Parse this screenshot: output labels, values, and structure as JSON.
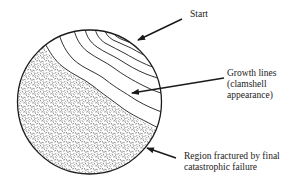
{
  "diagram": {
    "labels": {
      "start": "Start",
      "growth_lines": [
        "Growth lines",
        "(clamshell",
        "appearance)"
      ],
      "final_failure": [
        "Region fractured by final",
        "catastrophic failure"
      ]
    },
    "regions": [
      {
        "name": "fatigue-crack-growth-zone",
        "fill": "#ffffff",
        "pattern": "concentric growth lines"
      },
      {
        "name": "final-fracture-zone",
        "fill": "stippled",
        "pattern": "random dashes"
      }
    ],
    "colors": {
      "ink": "#1a1a1a",
      "background": "#ffffff"
    }
  }
}
